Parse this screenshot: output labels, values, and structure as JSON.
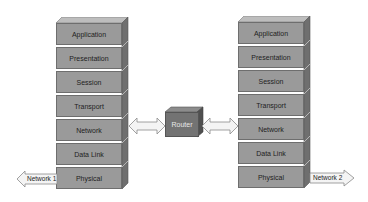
{
  "diagram": {
    "left_stack": {
      "layers": [
        "Application",
        "Presentation",
        "Session",
        "Transport",
        "Network",
        "Data Link",
        "Physical"
      ]
    },
    "right_stack": {
      "layers": [
        "Application",
        "Presentation",
        "Session",
        "Transport",
        "Network",
        "Data Link",
        "Physical"
      ]
    },
    "router": {
      "label": "Router"
    },
    "left_network": {
      "label": "Network 1"
    },
    "right_network": {
      "label": "Network 2"
    },
    "colors": {
      "layer_face": "#9a9a9a",
      "layer_top": "#bdbdbd",
      "layer_side": "#6f6f6f",
      "router_face": "#737373",
      "arrow_fill": "#f4f4f4",
      "arrow_stroke": "#8a8a8a"
    }
  }
}
